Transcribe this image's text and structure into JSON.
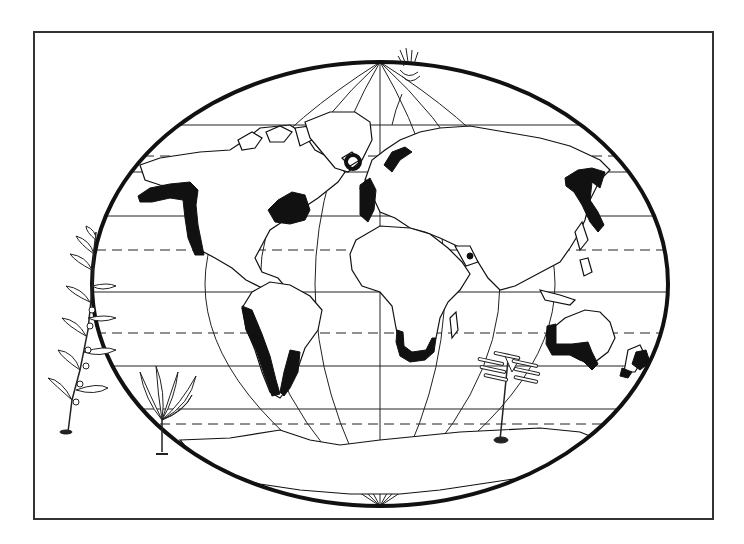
{
  "figure": {
    "type": "world-map-illustration",
    "colors": {
      "background": "#ffffff",
      "ink": "#111111",
      "frame": "#333333"
    },
    "frame": {
      "x": 33,
      "y": 31,
      "width": 680,
      "height": 488
    },
    "globe": {
      "cx": 380,
      "cy": 284,
      "rx": 288,
      "ry": 222
    },
    "highlighted_regions": [
      "north-pacific-alaska-to-california",
      "northwest-atlantic-newfoundland",
      "iceland",
      "northeast-atlantic-norway-britain",
      "northwest-pacific-japan-kamchatka",
      "west-coast-south-america",
      "east-coast-south-america-patagonia",
      "southern-africa",
      "southern-australia",
      "new-zealand",
      "arabian-coast-spot"
    ],
    "illustrations": [
      "seaweed-sprig-left",
      "kelp-plant-bottom-left",
      "kelp-frond-arctic",
      "laminaria-plant-indian-ocean"
    ]
  }
}
